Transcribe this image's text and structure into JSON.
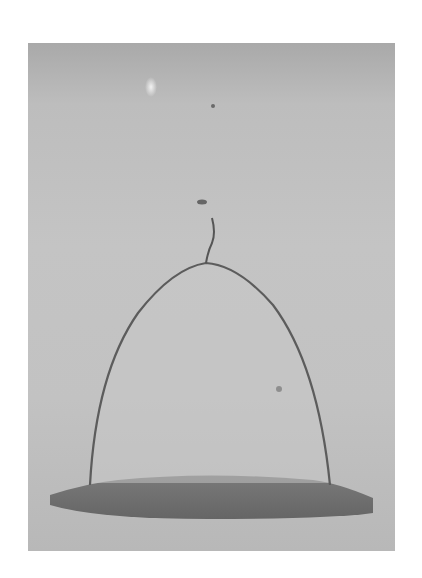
{
  "image": {
    "description": "Grayscale photograph of a bell-shaped liquid film dome on a flat surface with a thin filament at the apex",
    "colors": {
      "background": "#c2c2c2",
      "film_edge": "#5a5a5a",
      "base_pool": "#6e6e6e",
      "page": "#ffffff"
    }
  }
}
